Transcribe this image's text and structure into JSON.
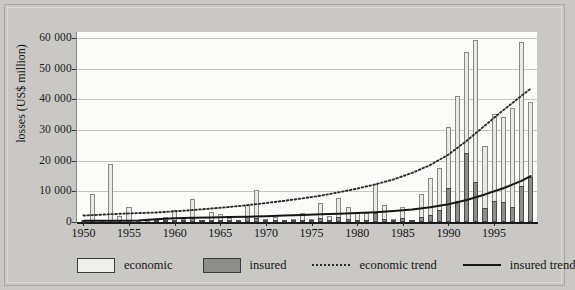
{
  "chart_data": {
    "type": "bar",
    "title": "",
    "xlabel": "",
    "ylabel": "losses (US$ million)",
    "ylim": [
      0,
      62000
    ],
    "xlim": [
      1949.3,
      1999.7
    ],
    "grid": true,
    "legend_position": "bottom",
    "y_ticks": [
      0,
      10000,
      20000,
      30000,
      40000,
      50000,
      60000
    ],
    "y_tick_labels": [
      "0",
      "10 000",
      "20 000",
      "30 000",
      "40 000",
      "50 000",
      "60 000"
    ],
    "x_ticks": [
      1950,
      1955,
      1960,
      1965,
      1970,
      1975,
      1980,
      1985,
      1990,
      1995
    ],
    "x_tick_labels": [
      "1950",
      "1955",
      "1960",
      "1965",
      "1970",
      "1975",
      "1980",
      "1985",
      "1990",
      "1995"
    ],
    "years": [
      1950,
      1951,
      1952,
      1953,
      1954,
      1955,
      1956,
      1957,
      1958,
      1959,
      1960,
      1961,
      1962,
      1963,
      1964,
      1965,
      1966,
      1967,
      1968,
      1969,
      1970,
      1971,
      1972,
      1973,
      1974,
      1975,
      1976,
      1977,
      1978,
      1979,
      1980,
      1981,
      1982,
      1983,
      1984,
      1985,
      1986,
      1987,
      1988,
      1989,
      1990,
      1991,
      1992,
      1993,
      1994,
      1995,
      1996,
      1997,
      1998,
      1999
    ],
    "series": [
      {
        "name": "economic",
        "color": "#e9e9e6",
        "values": [
          400,
          9000,
          500,
          19000,
          2000,
          5000,
          300,
          300,
          600,
          1500,
          3800,
          1000,
          7500,
          700,
          3200,
          2600,
          1300,
          500,
          5500,
          10400,
          900,
          1600,
          600,
          900,
          3000,
          1000,
          6200,
          1900,
          7900,
          5000,
          2800,
          3100,
          12500,
          5400,
          1000,
          4800,
          700,
          9000,
          14300,
          17600,
          30900,
          41000,
          55400,
          59300,
          24900,
          35100,
          34400,
          37100,
          58800,
          39000
        ]
      },
      {
        "name": "insured",
        "color": "#8d8d8a",
        "values": [
          0,
          0,
          0,
          0,
          0,
          0,
          0,
          0,
          100,
          200,
          300,
          100,
          1200,
          100,
          400,
          300,
          200,
          100,
          1800,
          1400,
          200,
          400,
          200,
          200,
          500,
          200,
          1200,
          400,
          1500,
          900,
          600,
          700,
          3000,
          1000,
          300,
          1300,
          200,
          1600,
          2200,
          4000,
          11200,
          6900,
          22500,
          13100,
          4500,
          6900,
          6500,
          4800,
          11700,
          14600
        ]
      }
    ],
    "trend_lines": [
      {
        "name": "economic trend",
        "style": "dotted",
        "color": "#2a2a28",
        "points": [
          [
            1950,
            2100
          ],
          [
            1952,
            2400
          ],
          [
            1954,
            2700
          ],
          [
            1956,
            2900
          ],
          [
            1958,
            3100
          ],
          [
            1960,
            3500
          ],
          [
            1962,
            3900
          ],
          [
            1964,
            4400
          ],
          [
            1966,
            4900
          ],
          [
            1968,
            5500
          ],
          [
            1970,
            6200
          ],
          [
            1972,
            6900
          ],
          [
            1974,
            7700
          ],
          [
            1976,
            8600
          ],
          [
            1978,
            9700
          ],
          [
            1980,
            10900
          ],
          [
            1982,
            12300
          ],
          [
            1984,
            13900
          ],
          [
            1986,
            16000
          ],
          [
            1988,
            18600
          ],
          [
            1990,
            22000
          ],
          [
            1992,
            26500
          ],
          [
            1994,
            31500
          ],
          [
            1996,
            36500
          ],
          [
            1998,
            41200
          ],
          [
            1999,
            43500
          ]
        ]
      },
      {
        "name": "insured trend",
        "style": "solid",
        "color": "#161614",
        "points": [
          [
            1950,
            400
          ],
          [
            1954,
            400
          ],
          [
            1956,
            500
          ],
          [
            1958,
            900
          ],
          [
            1960,
            1200
          ],
          [
            1962,
            1400
          ],
          [
            1964,
            1500
          ],
          [
            1966,
            1600
          ],
          [
            1968,
            1700
          ],
          [
            1970,
            1900
          ],
          [
            1972,
            2100
          ],
          [
            1974,
            2300
          ],
          [
            1976,
            2500
          ],
          [
            1978,
            2700
          ],
          [
            1980,
            2900
          ],
          [
            1982,
            3200
          ],
          [
            1984,
            3600
          ],
          [
            1986,
            4100
          ],
          [
            1988,
            4800
          ],
          [
            1990,
            5800
          ],
          [
            1992,
            7200
          ],
          [
            1994,
            9000
          ],
          [
            1996,
            11000
          ],
          [
            1998,
            13400
          ],
          [
            1999,
            15000
          ]
        ]
      }
    ]
  },
  "legend": {
    "items": [
      {
        "label": "economic",
        "marker": "swatch-light"
      },
      {
        "label": "insured",
        "marker": "swatch-dark"
      },
      {
        "label": "economic trend",
        "marker": "dotted-line"
      },
      {
        "label": "insured trend",
        "marker": "solid-line"
      }
    ]
  }
}
